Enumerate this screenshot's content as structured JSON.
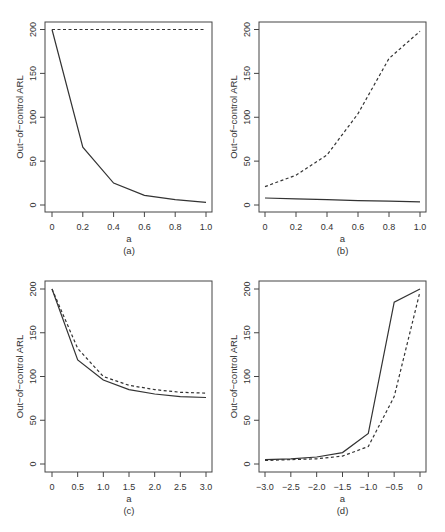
{
  "figure": {
    "panels": [
      {
        "id": "a",
        "caption": "(a)"
      },
      {
        "id": "b",
        "caption": "(b)"
      },
      {
        "id": "c",
        "caption": "(c)"
      },
      {
        "id": "d",
        "caption": "(d)"
      }
    ]
  },
  "chart_data": [
    {
      "type": "line",
      "panel": "(a)",
      "title": "",
      "xlabel": "a",
      "ylabel": "Out-of-control ARL",
      "x": [
        0,
        0.2,
        0.4,
        0.6,
        0.8,
        1.0
      ],
      "xticks": [
        "0",
        "0.2",
        "0.4",
        "0.6",
        "0.8",
        "1.0"
      ],
      "yticks": [
        "0",
        "50",
        "100",
        "150",
        "200"
      ],
      "xlim": [
        0,
        1.0
      ],
      "ylim": [
        0,
        200
      ],
      "grid": false,
      "legend": "none",
      "series": [
        {
          "name": "solid",
          "style": "solid",
          "values": [
            200,
            66,
            25,
            11,
            6,
            3
          ]
        },
        {
          "name": "dashed",
          "style": "dashed",
          "values": [
            200,
            200,
            200,
            200,
            200,
            200
          ]
        }
      ]
    },
    {
      "type": "line",
      "panel": "(b)",
      "title": "",
      "xlabel": "a",
      "ylabel": "Out-of-control ARL",
      "x": [
        0,
        0.2,
        0.4,
        0.6,
        0.8,
        1.0
      ],
      "xticks": [
        "0",
        "0.2",
        "0.4",
        "0.6",
        "0.8",
        "1.0"
      ],
      "yticks": [
        "0",
        "50",
        "100",
        "150",
        "200"
      ],
      "xlim": [
        0,
        1.0
      ],
      "ylim": [
        0,
        200
      ],
      "grid": false,
      "legend": "none",
      "series": [
        {
          "name": "solid",
          "style": "solid",
          "values": [
            8,
            7,
            6,
            5,
            4.5,
            3.5
          ]
        },
        {
          "name": "dashed",
          "style": "dashed",
          "values": [
            21,
            34,
            57,
            104,
            167,
            198
          ]
        }
      ]
    },
    {
      "type": "line",
      "panel": "(c)",
      "title": "",
      "xlabel": "a",
      "ylabel": "Out-of-control ARL",
      "x": [
        0,
        0.5,
        1.0,
        1.5,
        2.0,
        2.5,
        3.0
      ],
      "xticks": [
        "0",
        "0.5",
        "1.0",
        "1.5",
        "2.0",
        "2.5",
        "3.0"
      ],
      "yticks": [
        "0",
        "50",
        "100",
        "150",
        "200"
      ],
      "xlim": [
        0,
        3.0
      ],
      "ylim": [
        0,
        200
      ],
      "grid": false,
      "legend": "none",
      "series": [
        {
          "name": "solid",
          "style": "solid",
          "values": [
            200,
            119,
            96,
            85,
            80,
            77,
            76
          ]
        },
        {
          "name": "dashed",
          "style": "dashed",
          "values": [
            200,
            132,
            100,
            90,
            85,
            82,
            81
          ]
        }
      ]
    },
    {
      "type": "line",
      "panel": "(d)",
      "title": "",
      "xlabel": "a",
      "ylabel": "Out-of-control ARL",
      "x": [
        -3.0,
        -2.5,
        -2.0,
        -1.5,
        -1.0,
        -0.5,
        0
      ],
      "xticks": [
        "-3.0",
        "-2.5",
        "-2.0",
        "-1.5",
        "-1.0",
        "-0.5",
        "0"
      ],
      "yticks": [
        "0",
        "50",
        "100",
        "150",
        "200"
      ],
      "xlim": [
        -3.0,
        0
      ],
      "ylim": [
        0,
        200
      ],
      "grid": false,
      "legend": "none",
      "series": [
        {
          "name": "solid",
          "style": "solid",
          "values": [
            5,
            6,
            8,
            13,
            35,
            185,
            200
          ]
        },
        {
          "name": "dashed",
          "style": "dashed",
          "values": [
            4,
            5,
            6,
            9,
            20,
            77,
            197
          ]
        }
      ]
    }
  ]
}
